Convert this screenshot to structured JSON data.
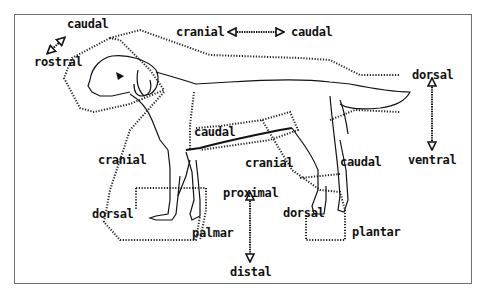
{
  "diagram": {
    "labels": {
      "top_left_caudal": "caudal",
      "top_left_rostral": "rostral",
      "top_cranial": "cranial",
      "top_caudal": "caudal",
      "right_dorsal": "dorsal",
      "right_ventral": "ventral",
      "fore_caudal": "caudal",
      "fore_cranial": "cranial",
      "hind_cranial": "cranial",
      "hind_caudal": "caudal",
      "fore_dorsal": "dorsal",
      "fore_palmar": "palmar",
      "proximal": "proximal",
      "distal": "distal",
      "hind_dorsal": "dorsal",
      "hind_plantar": "plantar"
    },
    "arrows": [
      {
        "name": "rostral-caudal-arrow",
        "direction": "diagonal"
      },
      {
        "name": "cranial-caudal-arrow",
        "direction": "horizontal"
      },
      {
        "name": "dorsal-ventral-arrow",
        "direction": "vertical"
      },
      {
        "name": "proximal-distal-arrow",
        "direction": "vertical"
      }
    ],
    "colors": {
      "ink": "#111111",
      "frame": "#707070",
      "background": "#ffffff"
    }
  }
}
